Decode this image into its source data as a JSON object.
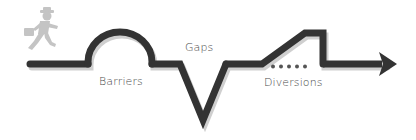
{
  "diagram": {
    "labels": {
      "barriers": "Barriers",
      "gaps": "Gaps",
      "diversions": "Diversions"
    },
    "icons": {
      "runner": "running-businessman-icon",
      "arrow": "arrow-right-icon"
    },
    "colors": {
      "path": "#333333",
      "shadow": "#c8c8c8",
      "runner": "#c4c4c4",
      "text": "#4a4a4a"
    },
    "diversion_dot_count": 5
  }
}
